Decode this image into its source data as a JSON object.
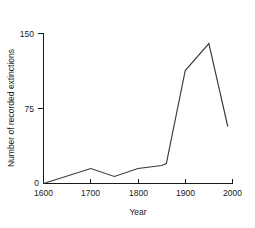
{
  "chart_data": {
    "type": "line",
    "title": "",
    "subtitle": "",
    "xlabel": "Year",
    "ylabel": "Number of recorded extinctions",
    "xlim": [
      1600,
      2000
    ],
    "ylim": [
      0,
      150
    ],
    "xticks": [
      1600,
      1700,
      1800,
      1900,
      2000
    ],
    "xticklabels": [
      "1600",
      "1700",
      "1800",
      "1900",
      "2000"
    ],
    "yticks": [
      0,
      75,
      150
    ],
    "yticklabels": [
      "0",
      "75",
      "150"
    ],
    "grid": false,
    "legend": false,
    "legend_position": "none",
    "series": [
      {
        "name": "Recorded extinctions",
        "x": [
          1600,
          1700,
          1750,
          1800,
          1850,
          1860,
          1900,
          1950,
          1990
        ],
        "values": [
          0,
          15,
          7,
          15,
          18,
          20,
          113,
          140,
          57
        ]
      }
    ]
  },
  "axes": {
    "y_top_label": "150",
    "y_mid_label": "75",
    "y_zero_label": "0",
    "x_labels": [
      "1600",
      "1700",
      "1800",
      "1900",
      "2000"
    ],
    "x_title": "Year",
    "y_title": "Number of recorded extinctions"
  },
  "colors": {
    "line": "#3a3a3a",
    "axis": "#1a1a1a",
    "background": "#ffffff",
    "text": "#1a1a1a"
  }
}
